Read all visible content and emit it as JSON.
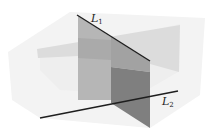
{
  "diagram": {
    "labels": {
      "line1": {
        "main": "L",
        "sub": "1"
      },
      "line2": {
        "main": "L",
        "sub": "2"
      }
    },
    "colors": {
      "background": "#ffffff",
      "outer_box": "#f1f1f1",
      "horizontal_plane": "#dedede",
      "vertical_plane_light": "#b4b4b4",
      "vertical_plane_mid": "#9a9a9a",
      "vertical_plane_dark": "#7e7e7e",
      "line": "#1e1e1e"
    }
  }
}
